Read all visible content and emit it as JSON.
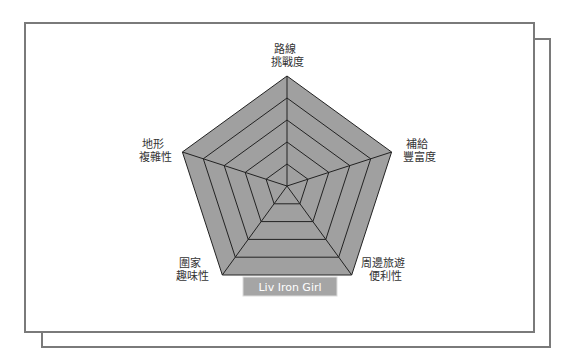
{
  "chart_data": {
    "type": "radar",
    "title": "",
    "axes": [
      {
        "label": [
          "路線",
          "挑戰度"
        ]
      },
      {
        "label": [
          "補給",
          "豐富度"
        ]
      },
      {
        "label": [
          "周邊旅遊",
          "便利性"
        ]
      },
      {
        "label": [
          "圍家",
          "趣味性"
        ]
      },
      {
        "label": [
          "地形",
          "複雜性"
        ]
      }
    ],
    "rings": 5,
    "range": [
      0,
      5
    ],
    "grid": true,
    "series": [
      {
        "name": "Liv Iron Girl",
        "values": [
          5,
          5,
          5,
          5,
          5
        ],
        "color": "#a0a0a0"
      }
    ],
    "legend": {
      "placement": "bottom",
      "label": "Liv Iron Girl"
    }
  },
  "colors": {
    "fill": "#a0a0a0",
    "grid": "#222222",
    "frame": "#7a7a7a",
    "legend_bg": "#a5a5a5"
  }
}
